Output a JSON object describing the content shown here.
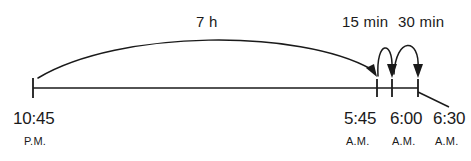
{
  "diagram": {
    "type": "elapsed-time-number-line",
    "title": "",
    "axis": {
      "line_color": "#1a1a1a",
      "start_x": 33,
      "end_x": 418,
      "baseline_y": 88
    },
    "ticks": [
      {
        "id": "tick-1045pm",
        "x": 33,
        "time": "10:45",
        "meridiem": "P.M."
      },
      {
        "id": "tick-545am",
        "x": 377,
        "time": "5:45",
        "meridiem": "A.M."
      },
      {
        "id": "tick-600am",
        "x": 392,
        "time": "6:00",
        "meridiem": "A.M."
      },
      {
        "id": "tick-630am",
        "x": 418,
        "time": "6:30",
        "meridiem": "A.M."
      }
    ],
    "arcs": [
      {
        "id": "arc-7h",
        "label": "7 h",
        "from_time": "10:45 P.M.",
        "to_time": "5:45 A.M.",
        "duration_minutes": 420
      },
      {
        "id": "arc-15min",
        "label": "15 min",
        "from_time": "5:45 A.M.",
        "to_time": "6:00 A.M.",
        "duration_minutes": 15
      },
      {
        "id": "arc-30min",
        "label": "30 min",
        "from_time": "6:00 A.M.",
        "to_time": "6:30 A.M.",
        "duration_minutes": 30
      }
    ],
    "labels": {
      "duration_7h": "7 h",
      "duration_15min": "15 min",
      "duration_30min": "30 min",
      "time_1045": "10:45",
      "meridiem_pm": "P.M.",
      "time_545": "5:45",
      "time_600": "6:00",
      "time_630": "6:30",
      "meridiem_am_1": "A.M.",
      "meridiem_am_2": "A.M.",
      "meridiem_am_3": "A.M."
    }
  }
}
